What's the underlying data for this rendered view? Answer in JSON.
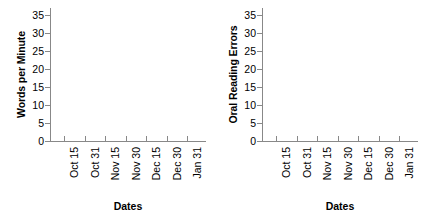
{
  "figure": {
    "background_color": "#ffffff",
    "axis_color": "#888888",
    "text_color": "#000000"
  },
  "chart_data": [
    {
      "type": "line",
      "title": "",
      "subtitle": "",
      "xlabel": "Dates",
      "ylabel": "Words per Minute",
      "categories": [
        "Oct 15",
        "Oct 31",
        "Nov 15",
        "Nov 30",
        "Dec 15",
        "Dec 30",
        "Jan 31"
      ],
      "x": [
        "Oct 15",
        "Oct 31",
        "Nov 15",
        "Nov 30",
        "Dec 15",
        "Dec 30",
        "Jan 31"
      ],
      "series": [],
      "values": [],
      "ylim": [
        0,
        37
      ],
      "yticks": [
        0,
        5,
        10,
        15,
        20,
        25,
        30,
        35
      ],
      "ytick_labels": [
        "0",
        "5",
        "10",
        "15",
        "20",
        "25",
        "30",
        "35"
      ],
      "grid": false,
      "legend": false,
      "legend_position": "none",
      "annotations": [],
      "note": "Empty axes; no data series plotted."
    },
    {
      "type": "line",
      "title": "",
      "subtitle": "",
      "xlabel": "Dates",
      "ylabel": "Oral Reading Errors",
      "categories": [
        "Oct 15",
        "Oct 31",
        "Nov 15",
        "Nov 30",
        "Dec 15",
        "Dec 30",
        "Jan 31"
      ],
      "x": [
        "Oct 15",
        "Oct 31",
        "Nov 15",
        "Nov 30",
        "Dec 15",
        "Dec 30",
        "Jan 31"
      ],
      "series": [],
      "values": [],
      "ylim": [
        0,
        37
      ],
      "yticks": [
        0,
        5,
        10,
        15,
        20,
        25,
        30,
        35
      ],
      "ytick_labels": [
        "0",
        "5",
        "10",
        "15",
        "20",
        "25",
        "30",
        "35"
      ],
      "grid": false,
      "legend": false,
      "legend_position": "none",
      "annotations": [],
      "note": "Empty axes; no data series plotted."
    }
  ]
}
